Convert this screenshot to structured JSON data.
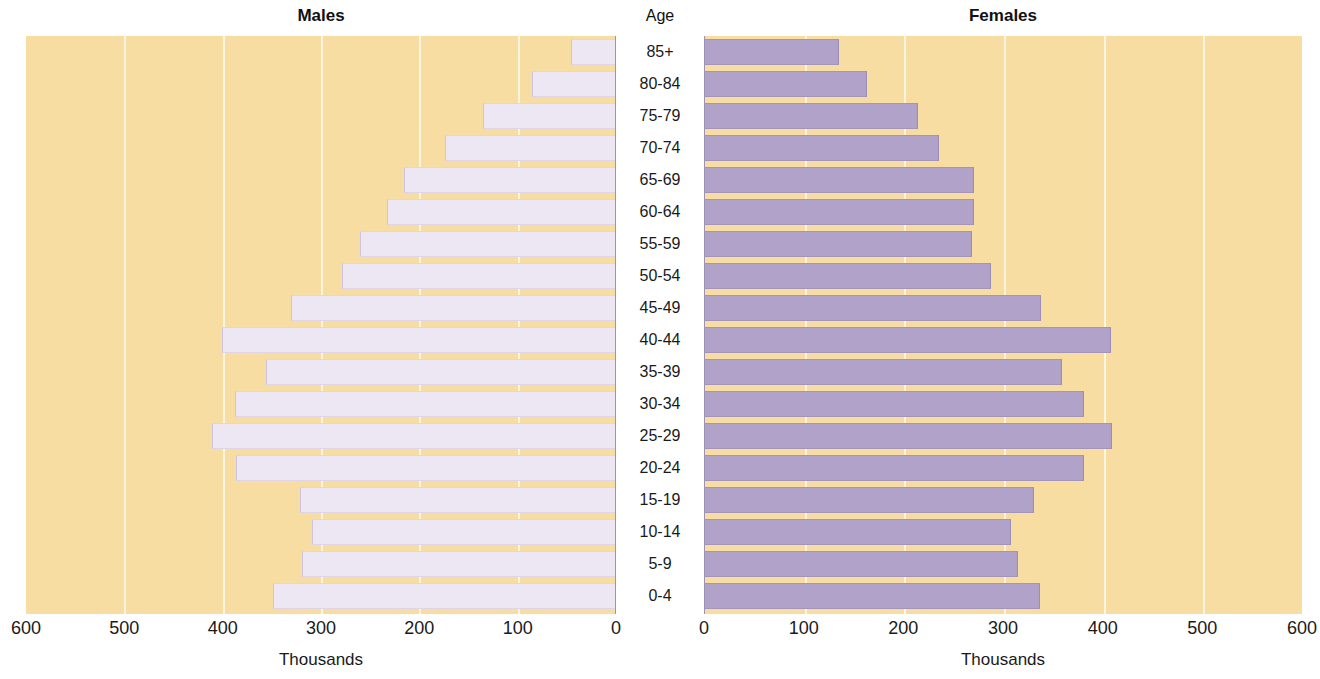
{
  "panels": {
    "males_title": "Males",
    "females_title": "Females",
    "age_title": "Age",
    "males_caption": "Thousands",
    "females_caption": "Thousands"
  },
  "colors": {
    "background": "#f7dda2",
    "male_bar": "#ece7f3",
    "female_bar": "#b1a2c9",
    "gridline": "#fdf6e3",
    "text": "#1a1a1a"
  },
  "chart_data": {
    "type": "bar",
    "subtitle": "",
    "orientation": "horizontal",
    "layout": "population-pyramid",
    "xlabel": "Thousands",
    "ylabel": "Age",
    "xlim": [
      0,
      600
    ],
    "xticks": [
      0,
      100,
      200,
      300,
      400,
      500,
      600
    ],
    "left_axis_ticks": [
      "600",
      "500",
      "400",
      "300",
      "200",
      "100",
      "0"
    ],
    "right_axis_ticks": [
      "0",
      "100",
      "200",
      "300",
      "400",
      "500",
      "600"
    ],
    "left_axis_reversed": true,
    "grid": true,
    "grid_axis": "x",
    "legend": "none",
    "categories": [
      "85+",
      "80-84",
      "75-79",
      "70-74",
      "65-69",
      "60-64",
      "55-59",
      "50-54",
      "45-49",
      "40-44",
      "35-39",
      "30-34",
      "25-29",
      "20-24",
      "15-19",
      "10-14",
      "5-9",
      "0-4"
    ],
    "series": [
      {
        "name": "Males",
        "side": "left",
        "values": [
          45,
          84,
          134,
          173,
          215,
          232,
          259,
          278,
          330,
          400,
          355,
          386,
          410,
          385,
          320,
          308,
          318,
          348
        ]
      },
      {
        "name": "Females",
        "side": "right",
        "values": [
          134,
          163,
          214,
          235,
          270,
          270,
          268,
          287,
          337,
          407,
          358,
          380,
          408,
          380,
          330,
          307,
          314,
          336
        ]
      }
    ]
  }
}
